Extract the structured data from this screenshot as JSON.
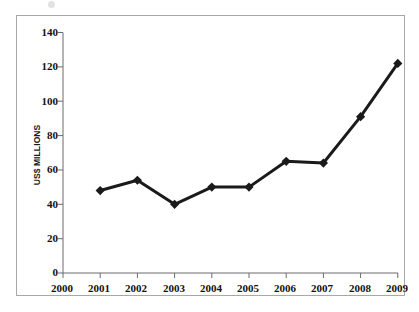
{
  "chart_data": {
    "type": "line",
    "title": "",
    "subtitle": "",
    "xlabel": "",
    "ylabel": "US$ MILLIONS",
    "categories": [
      "2000",
      "2001",
      "2002",
      "2003",
      "2004",
      "2005",
      "2006",
      "2007",
      "2008",
      "2009"
    ],
    "x_tick_labels": [
      "2000",
      "2001",
      "2002",
      "2003",
      "2004",
      "2005",
      "2006",
      "2007",
      "2008",
      "2009"
    ],
    "y_tick_labels": [
      "0",
      "20",
      "40",
      "60",
      "80",
      "100",
      "120",
      "140"
    ],
    "y_ticks": [
      0,
      20,
      40,
      60,
      80,
      100,
      120,
      140
    ],
    "ylim": [
      0,
      140
    ],
    "xlim": [
      "2000",
      "2009"
    ],
    "grid": false,
    "legend": false,
    "legend_position": "none",
    "series": [
      {
        "name": "US$ MILLIONS",
        "color": "#1a1a1a",
        "marker": "diamond",
        "line_width": 3,
        "x": [
          "2000",
          "2001",
          "2002",
          "2003",
          "2004",
          "2005",
          "2006",
          "2007",
          "2008",
          "2009"
        ],
        "values": [
          null,
          48,
          54,
          40,
          50,
          50,
          65,
          64,
          91,
          122
        ]
      }
    ],
    "annotations": []
  },
  "axes": {
    "y_axis_label": "US$ MILLIONS",
    "y_ticks": [
      {
        "label": "140",
        "value": 140
      },
      {
        "label": "120",
        "value": 120
      },
      {
        "label": "100",
        "value": 100
      },
      {
        "label": "80",
        "value": 80
      },
      {
        "label": "60",
        "value": 60
      },
      {
        "label": "40",
        "value": 40
      },
      {
        "label": "20",
        "value": 20
      },
      {
        "label": "0",
        "value": 0
      }
    ],
    "x_ticks": [
      {
        "label": "2000"
      },
      {
        "label": "2001"
      },
      {
        "label": "2002"
      },
      {
        "label": "2003"
      },
      {
        "label": "2004"
      },
      {
        "label": "2005"
      },
      {
        "label": "2006"
      },
      {
        "label": "2007"
      },
      {
        "label": "2008"
      },
      {
        "label": "2009"
      }
    ]
  },
  "style": {
    "background": "#ffffff",
    "frame_border": "#a8a8a8",
    "axis_color": "#555555",
    "series_color": "#1a1a1a",
    "tick_text_color": "#111111"
  }
}
